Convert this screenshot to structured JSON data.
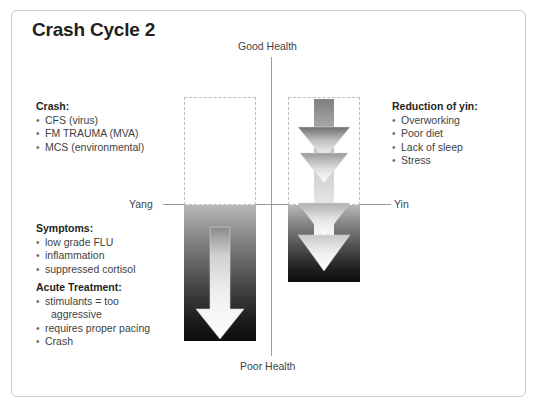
{
  "title": "Crash Cycle 2",
  "axes": {
    "top_label": "Good Health",
    "bottom_label": "Poor Health",
    "left_label": "Yang",
    "right_label": "Yin"
  },
  "blocks": {
    "crash": {
      "heading": "Crash:",
      "items": [
        "CFS (virus)",
        "FM TRAUMA (MVA)",
        "MCS (environmental)"
      ]
    },
    "symptoms": {
      "heading": "Symptoms:",
      "items": [
        "low grade FLU",
        "inflammation",
        "suppressed cortisol"
      ]
    },
    "acute_treatment": {
      "heading": "Acute Treatment:",
      "items": [
        "stimulants = too",
        "aggressive",
        "requires proper pacing",
        "Crash"
      ]
    },
    "reduction_of_yin": {
      "heading": "Reduction of yin:",
      "items": [
        "Overworking",
        "Poor diet",
        "Lack of sleep",
        "Stress"
      ]
    }
  },
  "columns": {
    "left": {
      "name": "yang-column",
      "dashed_label": "empty-reserve",
      "dark_label": "depleted-reserve",
      "arrow_label": "downward-arrow-single"
    },
    "right": {
      "name": "yin-column",
      "dashed_label": "empty-reserve",
      "dark_label": "depleted-reserve",
      "arrow_label": "downward-arrow-compound"
    }
  },
  "colors": {
    "frame_border": "#c9c9c9",
    "axis_line": "#9b9b9b",
    "dashed_border": "#bdbdbd",
    "text": "#3f3f3f",
    "heading": "#231f20",
    "gradient_top": "#b8b8b8",
    "gradient_bottom": "#0d0d0d",
    "arrow_fill_top": "#8f8f8f",
    "arrow_fill_bottom": "#ffffff"
  }
}
